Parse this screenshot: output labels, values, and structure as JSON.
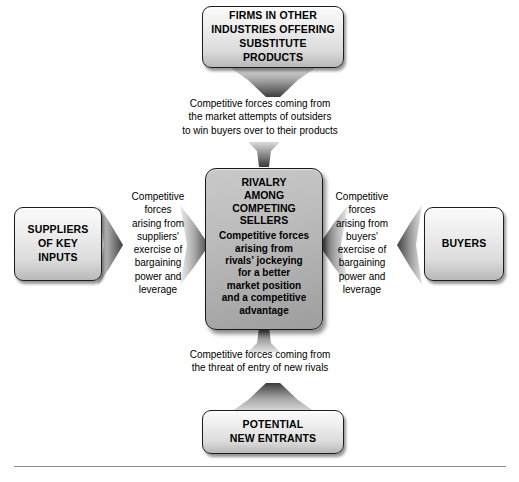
{
  "colors": {
    "box_light_top": "#fbfbfb",
    "box_light_bottom": "#b9b9b9",
    "center_box_fill": "#b4b4b4",
    "border": "#1c1c1c",
    "arrow_dark": "#4a4a4a",
    "arrow_light": "#d8d8d8",
    "text": "#000000",
    "footer_rule": "#8e8e8e",
    "page_background": "#ffffff"
  },
  "nodes": {
    "substitutes": {
      "label": "FIRMS IN OTHER\nINDUSTRIES OFFERING\nSUBSTITUTE PRODUCTS"
    },
    "suppliers": {
      "label": "SUPPLIERS\nOF KEY\nINPUTS"
    },
    "buyers": {
      "label": "BUYERS"
    },
    "new_entrants": {
      "label": "POTENTIAL\nNEW ENTRANTS"
    },
    "center": {
      "title": "RIVALRY\nAMONG\nCOMPETING\nSELLERS",
      "body": "Competitive forces\narising from\nrivals' jockeying\nfor a better\nmarket position\nand a competitive\nadvantage"
    }
  },
  "captions": {
    "top": "Competitive forces coming from\nthe market attempts of outsiders\nto win buyers over to their products",
    "bottom": "Competitive forces coming from\nthe threat of entry of new rivals",
    "left": "Competitive\nforces\narising from\nsuppliers'\nexercise of\nbargaining\npower and\nleverage",
    "right": "Competitive\nforces\narising from\nbuyers'\nexercise of\nbargaining\npower and\nleverage"
  },
  "arrows": [
    {
      "name": "arrow-substitutes-to-caption-top",
      "direction": "down"
    },
    {
      "name": "arrow-caption-top-to-center",
      "direction": "down"
    },
    {
      "name": "arrow-suppliers-to-caption-left",
      "direction": "right"
    },
    {
      "name": "arrow-caption-left-to-center",
      "direction": "right"
    },
    {
      "name": "arrow-center-to-caption-right",
      "direction": "right"
    },
    {
      "name": "arrow-caption-right-to-buyers",
      "direction": "left"
    },
    {
      "name": "arrow-center-to-caption-bottom",
      "direction": "up"
    },
    {
      "name": "arrow-new-entrants-to-caption-bottom",
      "direction": "up"
    }
  ]
}
